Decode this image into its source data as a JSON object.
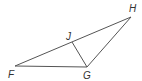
{
  "diagram": {
    "type": "geometry-triangle",
    "points": {
      "F": {
        "label": "F",
        "x": 15,
        "y": 66,
        "lx": 8,
        "ly": 78
      },
      "G": {
        "label": "G",
        "x": 87,
        "y": 67,
        "lx": 83,
        "ly": 79
      },
      "H": {
        "label": "H",
        "x": 131,
        "y": 17,
        "lx": 129,
        "ly": 12
      },
      "J": {
        "label": "J",
        "x": 72,
        "y": 42,
        "lx": 66,
        "ly": 40
      }
    },
    "segments": [
      {
        "from": "F",
        "to": "G"
      },
      {
        "from": "F",
        "to": "H"
      },
      {
        "from": "G",
        "to": "H"
      },
      {
        "from": "J",
        "to": "G"
      }
    ],
    "stroke_color": "#555555",
    "label_color": "#333333"
  }
}
